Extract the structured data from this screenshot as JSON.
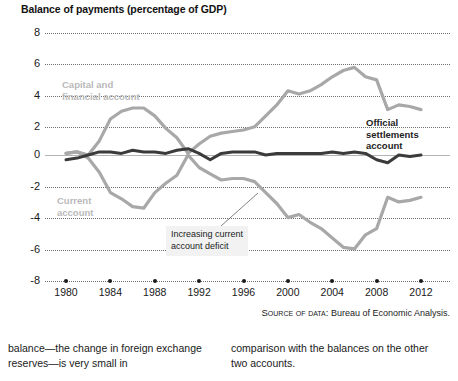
{
  "figure": {
    "title": "Balance of payments (percentage of GDP)",
    "source_prefix": "Source of data:",
    "source_text": "Bureau of Economic Analysis.",
    "labels": {
      "capital": "Capital and\nfinancial account",
      "current": "Current\naccount",
      "official": "Official\nsettlements\naccount",
      "callout": "Increasing current\naccount deficit"
    },
    "colors": {
      "capital": "#a8a8a8",
      "current": "#a8a8a8",
      "official": "#3b3b3b",
      "grid": "#6d6d6d",
      "zero_axis": "#b4b4b4",
      "label_grey": "#b9b9b9",
      "callout_bg": "#f2f2f2",
      "text": "#1a1a1a"
    }
  },
  "body_text": {
    "left": "balance—the change in foreign exchange reserves—is very small in",
    "right": "comparison with the balances on the other two accounts."
  },
  "chart_data": {
    "type": "line",
    "title": "Balance of payments (percentage of GDP)",
    "xlabel": "",
    "ylabel": "percentage of GDP",
    "xlim": [
      1979,
      2013
    ],
    "ylim": [
      -8,
      8
    ],
    "yticks": [
      8,
      6,
      4,
      2,
      0,
      -2,
      -4,
      -6,
      -8
    ],
    "xticks": [
      1980,
      1984,
      1988,
      1992,
      1996,
      2000,
      2004,
      2008,
      2012
    ],
    "grid": true,
    "legend": "in-chart labels",
    "x": [
      1980,
      1981,
      1982,
      1983,
      1984,
      1985,
      1986,
      1987,
      1988,
      1989,
      1990,
      1991,
      1992,
      1993,
      1994,
      1995,
      1996,
      1997,
      1998,
      1999,
      2000,
      2001,
      2002,
      2003,
      2004,
      2005,
      2006,
      2007,
      2008,
      2009,
      2010,
      2011,
      2012
    ],
    "series": [
      {
        "name": "Capital and financial account",
        "color": "#a8a8a8",
        "values": [
          0.1,
          0.2,
          0.0,
          0.9,
          2.3,
          2.8,
          3.0,
          3.0,
          2.5,
          1.7,
          1.1,
          0.1,
          0.7,
          1.2,
          1.4,
          1.5,
          1.6,
          1.8,
          2.5,
          3.2,
          4.1,
          3.9,
          4.1,
          4.5,
          5.0,
          5.4,
          5.6,
          5.0,
          4.8,
          2.9,
          3.2,
          3.1,
          2.9
        ]
      },
      {
        "name": "Current account",
        "color": "#a8a8a8",
        "values": [
          0.1,
          0.2,
          -0.2,
          -1.1,
          -2.4,
          -2.8,
          -3.3,
          -3.4,
          -2.4,
          -1.8,
          -1.3,
          0.0,
          -0.8,
          -1.2,
          -1.6,
          -1.5,
          -1.5,
          -1.7,
          -2.4,
          -3.1,
          -4.0,
          -3.8,
          -4.3,
          -4.7,
          -5.3,
          -5.9,
          -6.0,
          -5.1,
          -4.7,
          -2.7,
          -3.0,
          -2.9,
          -2.7
        ]
      },
      {
        "name": "Official settlements account",
        "color": "#3b3b3b",
        "values": [
          -0.3,
          -0.2,
          0.0,
          0.2,
          0.2,
          0.1,
          0.3,
          0.2,
          0.2,
          0.1,
          0.3,
          0.4,
          0.1,
          -0.3,
          0.1,
          0.2,
          0.2,
          0.2,
          0.0,
          0.1,
          0.1,
          0.1,
          0.1,
          0.1,
          0.2,
          0.1,
          0.2,
          0.1,
          -0.3,
          -0.5,
          0.0,
          -0.1,
          0.0
        ]
      }
    ],
    "annotations": [
      {
        "text": "Increasing current account deficit",
        "points_to_year": 1999,
        "points_to_value": -3.0
      }
    ]
  }
}
